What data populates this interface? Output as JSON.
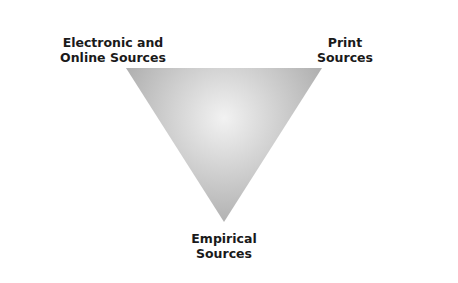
{
  "diagram": {
    "type": "inverted-triangle",
    "vertices": {
      "top_left": {
        "label_lines": [
          "Electronic and",
          "Online Sources"
        ]
      },
      "top_right": {
        "label_lines": [
          "Print",
          "Sources"
        ]
      },
      "bottom": {
        "label_lines": [
          "Empirical",
          "Sources"
        ]
      }
    },
    "colors": {
      "fill_center": "#f2f2f2",
      "fill_edge": "#a8a8a8",
      "text": "#1a1a1a"
    }
  }
}
